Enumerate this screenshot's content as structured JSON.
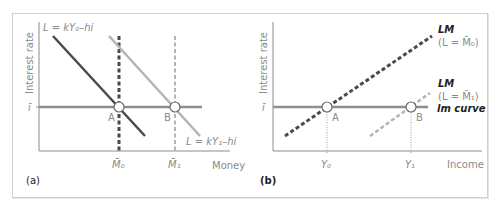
{
  "colors": {
    "axis": "#8c8c8c",
    "dark_line": "#4a4a4a",
    "light_line": "#b4b4b4",
    "horizontal_line": "#8e8e8e",
    "label": "#8a8a8a",
    "bold_label": "#222222",
    "frame": "#cfcfcf"
  },
  "panel_a": {
    "tag": "(a)",
    "y_axis_label": "Interest rate",
    "x_axis_label": "Money",
    "i_bar_label": "ī",
    "curve_1_label": "L = kY₀–hi",
    "curve_2_label": "L = kY₁–hi",
    "point_a_label": "A",
    "point_b_label": "B",
    "tick_1_label": "M̄₀",
    "tick_2_label": "M̄₁"
  },
  "panel_b": {
    "tag": "(b)",
    "y_axis_label": "Interest rate",
    "x_axis_label": "Income",
    "i_bar_label": "ī",
    "lm0_title": "LM",
    "lm0_sub": "(L = M̄₀)",
    "lm1_title": "LM",
    "lm1_sub": "(L = M̄₁)",
    "lm_curve_label": "lm curve",
    "point_a_label": "A",
    "point_b_label": "B",
    "tick_1_label": "Y₀",
    "tick_2_label": "Y₁"
  }
}
